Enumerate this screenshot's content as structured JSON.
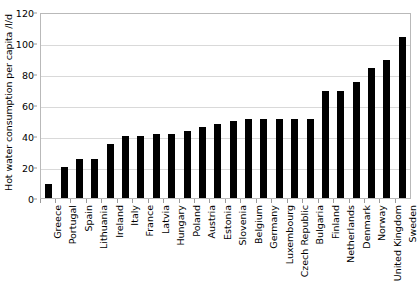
{
  "chart_data": {
    "type": "bar",
    "title": "",
    "xlabel": "",
    "ylabel": "Hot water consumption per capita /l/d",
    "ylim": [
      0,
      120
    ],
    "yticks": [
      0,
      20,
      40,
      60,
      80,
      100,
      120
    ],
    "ytick_labels": [
      "0",
      "20",
      "40",
      "60",
      "80",
      "100",
      "120"
    ],
    "grid": true,
    "legend": "none",
    "bar_color": "#000000",
    "categories": [
      "Greece",
      "Portugal",
      "Spain",
      "Lithuania",
      "Ireland",
      "Italy",
      "France",
      "Latvia",
      "Hungary",
      "Poland",
      "Austria",
      "Estonia",
      "Slovenia",
      "Belgium",
      "Germany",
      "Luxembourg",
      "Czech Republic",
      "Bulgaria",
      "Finland",
      "Netherlands",
      "Denmark",
      "Norway",
      "United Kingdom",
      "Sweden"
    ],
    "values": [
      9,
      20,
      25,
      25,
      35,
      40,
      40,
      41,
      41,
      43,
      46,
      48,
      50,
      51,
      51,
      51,
      51,
      51,
      69,
      69,
      75,
      84,
      89,
      104
    ]
  }
}
